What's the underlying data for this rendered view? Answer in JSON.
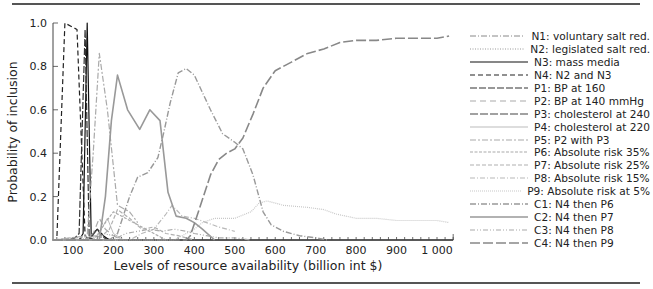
{
  "chart_data": {
    "type": "line",
    "title": "",
    "xlabel": "Levels of resource availability (billion int $)",
    "ylabel": "Probability of inclusion",
    "xlim": [
      50,
      1040
    ],
    "ylim": [
      0,
      1.0
    ],
    "xticks": [
      100,
      200,
      300,
      400,
      500,
      600,
      700,
      800,
      900,
      1000
    ],
    "xtick_labels": [
      "100",
      "200",
      "300",
      "400",
      "500",
      "600",
      "700",
      "800",
      "900",
      "1 000"
    ],
    "yticks": [
      0.0,
      0.2,
      0.4,
      0.6,
      0.8,
      1.0
    ],
    "ytick_labels": [
      "0.0",
      "0.2",
      "0.4",
      "0.6",
      "0.8",
      "1.0"
    ],
    "grid": false,
    "legend_position": "right",
    "series": [
      {
        "name": "N1: voluntary salt red.",
        "color": "#888888",
        "dash": "6,2,1,2",
        "width": 1.0,
        "x": [
          50,
          75,
          100,
          125,
          150,
          175,
          200
        ],
        "y": [
          0,
          0,
          0,
          0,
          0.02,
          0.01,
          0
        ]
      },
      {
        "name": "N2: legislated salt red.",
        "color": "#999999",
        "dash": "1,1.5",
        "width": 1.0,
        "x": [
          50,
          100,
          150,
          175,
          200,
          225
        ],
        "y": [
          0,
          0,
          0.01,
          0.03,
          0.02,
          0
        ]
      },
      {
        "name": "N3: mass media",
        "color": "#111111",
        "dash": "",
        "width": 1.2,
        "x": [
          50,
          100,
          115,
          125,
          135,
          145,
          160,
          175,
          190
        ],
        "y": [
          0,
          0,
          0,
          0.03,
          1.0,
          0.02,
          0.05,
          0.02,
          0
        ]
      },
      {
        "name": "N4: N2 and N3",
        "color": "#222222",
        "dash": "5,3",
        "width": 1.2,
        "x": [
          50,
          60,
          80,
          110,
          130,
          140,
          150
        ],
        "y": [
          0,
          0,
          1.0,
          0.97,
          0.02,
          0,
          0
        ]
      },
      {
        "name": "P1: BP at 160",
        "color": "#333333",
        "dash": "7,2",
        "width": 1.2,
        "x": [
          50,
          80,
          105,
          115,
          130,
          140,
          155,
          170
        ],
        "y": [
          0,
          0,
          0.01,
          0.03,
          0.97,
          0.01,
          0,
          0
        ]
      },
      {
        "name": "P2: BP at 140 mmHg",
        "color": "#aaaaaa",
        "dash": "6,4",
        "width": 1.2,
        "x": [
          50,
          130,
          150,
          165,
          180,
          200,
          220
        ],
        "y": [
          0,
          0,
          0.03,
          0.1,
          0.05,
          0.02,
          0
        ]
      },
      {
        "name": "P3: cholesterol at 240",
        "color": "#444444",
        "dash": "8,2",
        "width": 1.2,
        "x": [
          50,
          140,
          160,
          170,
          185,
          200
        ],
        "y": [
          0,
          0,
          0.05,
          0.02,
          0,
          0
        ]
      },
      {
        "name": "P4: cholesterol at 220",
        "color": "#bbbbbb",
        "dash": "",
        "width": 1.0,
        "x": [
          50,
          150,
          170,
          185,
          200,
          225
        ],
        "y": [
          0,
          0,
          0.05,
          0.1,
          0.03,
          0
        ]
      },
      {
        "name": "P5: P2 with P3",
        "color": "#aaaaaa",
        "dash": "6,2,2,2",
        "width": 1.2,
        "x": [
          50,
          135,
          150,
          165,
          185,
          210,
          240,
          260
        ],
        "y": [
          0,
          0.02,
          0.4,
          0.86,
          0.6,
          0.16,
          0.13,
          0.08
        ]
      },
      {
        "name": "P6: Absolute risk 35%",
        "color": "#aaaaaa",
        "dash": "3,1.5",
        "width": 1.2,
        "x": [
          50,
          160,
          180,
          200,
          230,
          260,
          300,
          330
        ],
        "y": [
          0,
          0.02,
          0.08,
          0.13,
          0.1,
          0.07,
          0.03,
          0
        ]
      },
      {
        "name": "P7: Absolute risk 25%",
        "color": "#b0b0b0",
        "dash": "4,2",
        "width": 1.2,
        "x": [
          50,
          160,
          190,
          210,
          240,
          270,
          300,
          330,
          360,
          400
        ],
        "y": [
          0,
          0,
          0.05,
          0.14,
          0.1,
          0.05,
          0.06,
          0.03,
          0.02,
          0
        ]
      },
      {
        "name": "P8: Absolute risk 15%",
        "color": "#b8b8b8",
        "dash": "5,2,1,2",
        "width": 1.2,
        "x": [
          50,
          240,
          270,
          300,
          330,
          345,
          370,
          400,
          430,
          460,
          500
        ],
        "y": [
          0,
          0,
          0.03,
          0.05,
          0.12,
          0.16,
          0.11,
          0.1,
          0.08,
          0.06,
          0.04
        ]
      },
      {
        "name": "P9: Absolute risk at 5%",
        "color": "#c8c8c8",
        "dash": "1,1",
        "width": 1.2,
        "x": [
          50,
          350,
          400,
          420,
          450,
          500,
          540,
          560,
          580,
          620,
          680,
          720,
          750,
          800,
          850,
          900,
          950,
          1000,
          1030
        ],
        "y": [
          0,
          0,
          0.05,
          0.08,
          0.1,
          0.1,
          0.13,
          0.17,
          0.18,
          0.16,
          0.15,
          0.14,
          0.12,
          0.1,
          0.1,
          0.09,
          0.09,
          0.09,
          0.08
        ]
      },
      {
        "name": "C1: N4 then P6",
        "color": "#999999",
        "dash": "6,2,1,2",
        "width": 1.4,
        "x": [
          50,
          190,
          210,
          240,
          260,
          285,
          310,
          325,
          340,
          360,
          380,
          400,
          420,
          440,
          470,
          500,
          520,
          545,
          570,
          590,
          620,
          660,
          700,
          730
        ],
        "y": [
          0,
          0,
          0.03,
          0.2,
          0.29,
          0.31,
          0.38,
          0.5,
          0.63,
          0.77,
          0.79,
          0.76,
          0.68,
          0.6,
          0.49,
          0.45,
          0.42,
          0.3,
          0.13,
          0.07,
          0.04,
          0.02,
          0.01,
          0
        ]
      },
      {
        "name": "C2: N4 then P7",
        "color": "#999999",
        "dash": "",
        "width": 1.6,
        "x": [
          50,
          165,
          180,
          195,
          210,
          235,
          265,
          290,
          315,
          335,
          355,
          380,
          400,
          420,
          450
        ],
        "y": [
          0,
          0,
          0.2,
          0.55,
          0.76,
          0.6,
          0.51,
          0.6,
          0.55,
          0.22,
          0.11,
          0.1,
          0.08,
          0.05,
          0
        ]
      },
      {
        "name": "C3: N4 then P8",
        "color": "#aaaaaa",
        "dash": "5,2,1,2,1,2",
        "width": 1.2,
        "x": [
          50,
          200,
          230,
          260,
          290,
          320,
          350,
          380,
          400,
          430,
          460,
          500,
          540
        ],
        "y": [
          0,
          0,
          0.03,
          0.04,
          0.05,
          0.04,
          0.05,
          0.04,
          0.03,
          0.02,
          0.01,
          0.01,
          0
        ]
      },
      {
        "name": "C4: N4 then P9",
        "color": "#888888",
        "dash": "10,3",
        "width": 1.6,
        "x": [
          50,
          380,
          390,
          410,
          440,
          460,
          480,
          500,
          520,
          545,
          570,
          600,
          640,
          680,
          720,
          760,
          800,
          850,
          900,
          950,
          1000,
          1030
        ],
        "y": [
          0,
          0,
          0.02,
          0.13,
          0.3,
          0.37,
          0.4,
          0.42,
          0.47,
          0.58,
          0.7,
          0.78,
          0.82,
          0.86,
          0.88,
          0.91,
          0.92,
          0.92,
          0.93,
          0.93,
          0.93,
          0.94
        ]
      }
    ]
  },
  "legend": {
    "items": [
      {
        "label": "N1: voluntary salt red."
      },
      {
        "label": "N2: legislated salt red."
      },
      {
        "label": "N3: mass media"
      },
      {
        "label": "N4: N2 and N3"
      },
      {
        "label": "P1: BP at 160"
      },
      {
        "label": "P2: BP at 140 mmHg"
      },
      {
        "label": "P3: cholesterol at 240"
      },
      {
        "label": "P4: cholesterol at 220"
      },
      {
        "label": "P5: P2 with P3"
      },
      {
        "label": "P6: Absolute risk 35%"
      },
      {
        "label": "P7: Absolute risk 25%"
      },
      {
        "label": "P8: Absolute risk 15%"
      },
      {
        "label": "P9: Absolute risk at 5%"
      },
      {
        "label": "C1: N4 then P6"
      },
      {
        "label": "C2: N4 then P7"
      },
      {
        "label": "C3: N4 then P8"
      },
      {
        "label": "C4: N4 then P9"
      }
    ]
  }
}
